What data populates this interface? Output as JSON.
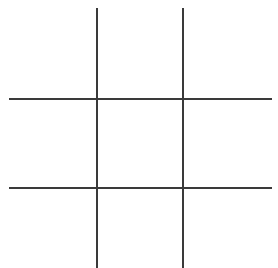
{
  "game": {
    "type": "tic-tac-toe",
    "line_color": "#3a3a3a",
    "background": "#ffffff",
    "cells": [
      {
        "row": 0,
        "col": 0,
        "mark": ""
      },
      {
        "row": 0,
        "col": 1,
        "mark": ""
      },
      {
        "row": 0,
        "col": 2,
        "mark": ""
      },
      {
        "row": 1,
        "col": 0,
        "mark": ""
      },
      {
        "row": 1,
        "col": 1,
        "mark": ""
      },
      {
        "row": 1,
        "col": 2,
        "mark": ""
      },
      {
        "row": 2,
        "col": 0,
        "mark": ""
      },
      {
        "row": 2,
        "col": 1,
        "mark": ""
      },
      {
        "row": 2,
        "col": 2,
        "mark": ""
      }
    ]
  }
}
